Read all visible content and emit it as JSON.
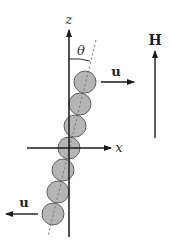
{
  "diagram": {
    "axes": {
      "z_label": "z",
      "x_label": "x"
    },
    "angle_label": "θ",
    "velocity_top": {
      "label": "u",
      "direction": "right"
    },
    "velocity_bottom": {
      "label": "u",
      "direction": "left"
    },
    "field": {
      "label": "H",
      "direction": "up"
    },
    "particles": {
      "count": 7,
      "fill_color": "#b5b5b5",
      "stroke_color": "#555555",
      "centers": [
        [
          85,
          82
        ],
        [
          80,
          104
        ],
        [
          75,
          126
        ],
        [
          69,
          148
        ],
        [
          63,
          170
        ],
        [
          58,
          192
        ],
        [
          53,
          214
        ]
      ],
      "radius": 11
    },
    "colors": {
      "line": "#1a1a1a",
      "dashed": "#777777",
      "background": "#ffffff"
    }
  }
}
